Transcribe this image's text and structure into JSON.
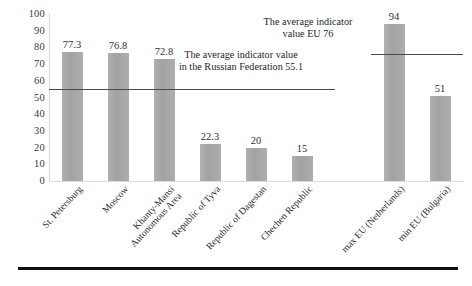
{
  "chart_data": {
    "type": "bar",
    "title": "",
    "xlabel": "",
    "ylabel": "",
    "ylim": [
      0,
      100
    ],
    "yticks": [
      100,
      90,
      80,
      70,
      60,
      50,
      40,
      30,
      20,
      10,
      0
    ],
    "grid": false,
    "legend": "none",
    "categories": [
      "St. Petersburg",
      "Moscow",
      "Khanty-Mansi Autonomous Area",
      "Republic of Tyva",
      "Republic of Dagestan",
      "Chechen Republic",
      "max EU (Netherlands)",
      "min EU (Bulgaria)"
    ],
    "values": [
      77.3,
      76.8,
      72.8,
      22.3,
      20,
      15,
      94,
      51
    ],
    "value_labels": [
      "77.3",
      "76.8",
      "72.8",
      "22.3",
      "20",
      "15",
      "94",
      "51"
    ],
    "reference_lines": [
      {
        "name": "russian-federation-average",
        "value": 55.1,
        "label": "The average indicator value in the Russian Federation 55.1",
        "label_line1": "The average indicator value",
        "label_line2": "in the Russian Federation 55.1",
        "spans_categories": [
          0,
          5
        ]
      },
      {
        "name": "eu-average",
        "value": 76,
        "label": "The average indicator value EU 76",
        "label_line1": "The average indicator",
        "label_line2": "value EU 76",
        "spans_categories": [
          6,
          7
        ]
      }
    ],
    "bar_color": "#a8a8a8",
    "reference_line_color": "#4a4a4a",
    "axis_color": "#d9d9d9"
  },
  "categories_wrapped": [
    [
      "St. Petersburg"
    ],
    [
      "Moscow"
    ],
    [
      "Khanty-Mansi",
      "Autonomous Area"
    ],
    [
      "Republic of Tyva"
    ],
    [
      "Republic of Dagestan"
    ],
    [
      "Chechen Republic"
    ],
    [
      "max EU (Netherlands)"
    ],
    [
      "min EU (Bulgaria)"
    ]
  ]
}
